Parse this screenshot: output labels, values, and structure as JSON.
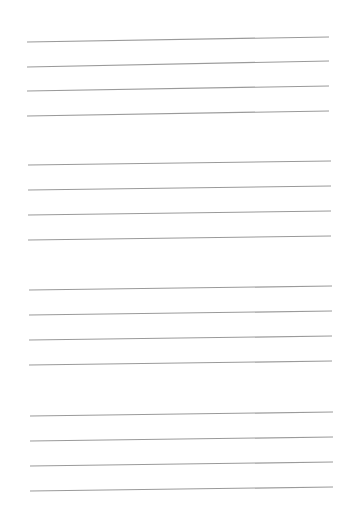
{
  "page": {
    "background_color": "#ffffff",
    "line_color": "#9a9a9a",
    "line_width": 1.2,
    "groups": [
      {
        "lines": [
          {
            "x1": 27,
            "y1": 42,
            "x2": 329,
            "y2": 37
          },
          {
            "x1": 27,
            "y1": 67,
            "x2": 329,
            "y2": 61
          },
          {
            "x1": 27,
            "y1": 91,
            "x2": 329,
            "y2": 86
          },
          {
            "x1": 27,
            "y1": 116,
            "x2": 329,
            "y2": 111
          }
        ]
      },
      {
        "lines": [
          {
            "x1": 28,
            "y1": 165,
            "x2": 331,
            "y2": 161
          },
          {
            "x1": 28,
            "y1": 190,
            "x2": 331,
            "y2": 186
          },
          {
            "x1": 28,
            "y1": 215,
            "x2": 331,
            "y2": 211
          },
          {
            "x1": 28,
            "y1": 240,
            "x2": 331,
            "y2": 236
          }
        ]
      },
      {
        "lines": [
          {
            "x1": 29,
            "y1": 290,
            "x2": 332,
            "y2": 286
          },
          {
            "x1": 29,
            "y1": 315,
            "x2": 332,
            "y2": 311
          },
          {
            "x1": 29,
            "y1": 340,
            "x2": 332,
            "y2": 336
          },
          {
            "x1": 29,
            "y1": 365,
            "x2": 332,
            "y2": 361
          }
        ]
      },
      {
        "lines": [
          {
            "x1": 30,
            "y1": 416,
            "x2": 333,
            "y2": 412
          },
          {
            "x1": 30,
            "y1": 441,
            "x2": 333,
            "y2": 437
          },
          {
            "x1": 30,
            "y1": 466,
            "x2": 333,
            "y2": 462
          },
          {
            "x1": 30,
            "y1": 491,
            "x2": 333,
            "y2": 487
          }
        ]
      }
    ]
  }
}
